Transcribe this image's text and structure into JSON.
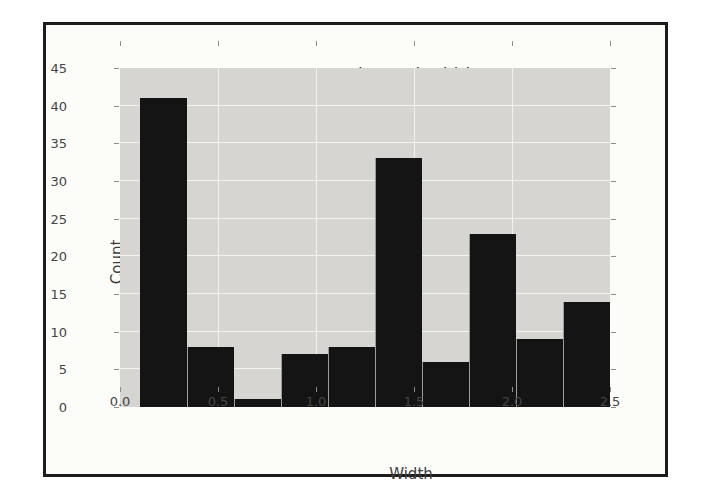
{
  "chart_data": {
    "type": "bar",
    "subtype": "histogram",
    "title": "Iris Petal Width",
    "xlabel": "Width",
    "ylabel": "Count",
    "bin_start": 0.1,
    "bin_width": 0.24,
    "bin_edges": [
      0.1,
      0.34,
      0.58,
      0.82,
      1.06,
      1.3,
      1.54,
      1.78,
      2.02,
      2.26,
      2.5
    ],
    "values": [
      41,
      8,
      1,
      7,
      8,
      33,
      6,
      23,
      9,
      14
    ],
    "total_count": 150,
    "xlim": [
      0.0,
      2.5
    ],
    "ylim": [
      0,
      45
    ],
    "x_tick_values": [
      0.0,
      0.5,
      1.0,
      1.5,
      2.0,
      2.5
    ],
    "x_tick_labels": [
      "0.0",
      "0.5",
      "1.0",
      "1.5",
      "2.0",
      "2.5"
    ],
    "y_tick_values": [
      0,
      5,
      10,
      15,
      20,
      25,
      30,
      35,
      40,
      45
    ],
    "y_tick_labels": [
      "0",
      "5",
      "10",
      "15",
      "20",
      "25",
      "30",
      "35",
      "40",
      "45"
    ],
    "grid": true,
    "legend": false,
    "colors": {
      "bar": "#141414",
      "plot_background": "#d6d5d1",
      "gridline": "#f3f3ee",
      "figure_background": "#fcfcf9",
      "page_background": "#ffffff",
      "frame_border": "#1c1c1c",
      "text": "#3d3d3d"
    }
  }
}
